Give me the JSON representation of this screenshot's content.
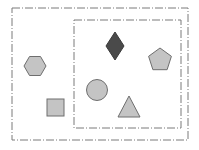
{
  "diagram": {
    "background": "#ffffff",
    "stroke_color": "#7a7a7a",
    "fill_light": "#c4c4c4",
    "fill_dark": "#4a4a4a",
    "shape_stroke": "#6e6e6e",
    "boxes": [
      {
        "id": "outer-box",
        "x": 12,
        "y": 8,
        "width": 176,
        "height": 132,
        "style": "dash-dot"
      },
      {
        "id": "inner-box",
        "x": 74,
        "y": 20,
        "width": 107,
        "height": 108,
        "style": "dash-dot"
      }
    ],
    "shapes": [
      {
        "type": "hexagon",
        "cx": 35,
        "cy": 66,
        "r": 11,
        "fill": "light",
        "container": "outer-box"
      },
      {
        "type": "square",
        "x": 47,
        "y": 99,
        "size": 17,
        "fill": "light",
        "container": "outer-box"
      },
      {
        "type": "diamond",
        "cx": 115,
        "cy": 46,
        "w": 18,
        "h": 28,
        "fill": "dark",
        "container": "inner-box"
      },
      {
        "type": "pentagon",
        "cx": 160,
        "cy": 60,
        "r": 12,
        "fill": "light",
        "container": "inner-box"
      },
      {
        "type": "circle",
        "cx": 97,
        "cy": 90,
        "r": 10.5,
        "fill": "light",
        "container": "inner-box"
      },
      {
        "type": "triangle",
        "x1": 118,
        "y1": 117,
        "x2": 140,
        "y2": 117,
        "x3": 129,
        "y3": 96,
        "fill": "light",
        "container": "inner-box"
      }
    ]
  }
}
